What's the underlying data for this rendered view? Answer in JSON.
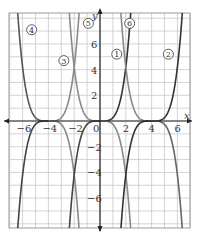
{
  "chart_data": {
    "type": "line",
    "title": "",
    "xlabel": "x",
    "ylabel": "y",
    "xlim": [
      -7,
      7
    ],
    "ylim": [
      -8.3,
      8.5
    ],
    "grid": true,
    "x_ticks": [
      "-6",
      "-4",
      "-2",
      "0",
      "2",
      "4",
      "6"
    ],
    "y_ticks": [
      "6",
      "4",
      "2",
      "-2",
      "-4",
      "-6"
    ],
    "series": [
      {
        "name": "1",
        "vertex_x": 0,
        "direction": "up",
        "branch": "right",
        "color": "#333333"
      },
      {
        "name": "2",
        "vertex_x": 4,
        "direction": "up",
        "branch": "right",
        "color": "#333333"
      },
      {
        "name": "3",
        "vertex_x": -4,
        "direction": "up",
        "branch": "right",
        "color": "#888888"
      },
      {
        "name": "4",
        "vertex_x": -4,
        "direction": "up",
        "branch": "left",
        "color": "#555555"
      },
      {
        "name": "5",
        "vertex_x": 0,
        "direction": "up",
        "branch": "left",
        "color": "#888888"
      },
      {
        "name": "6",
        "vertex_x": 4,
        "direction": "up",
        "branch": "left",
        "color": "#888888"
      }
    ],
    "curves": [
      {
        "vertex_x": -4,
        "sign": 1,
        "color_left": "#555555",
        "color_right": "#8a8a8a"
      },
      {
        "vertex_x": 0,
        "sign": 1,
        "color_left": "#8a8a8a",
        "color_right": "#333333"
      },
      {
        "vertex_x": 4,
        "sign": 1,
        "color_left": "#8a8a8a",
        "color_right": "#333333"
      },
      {
        "vertex_x": -4,
        "sign": -1,
        "color_left": "#444444",
        "color_right": "#8a8a8a"
      },
      {
        "vertex_x": 0,
        "sign": -1,
        "color_left": "#444444",
        "color_right": "#8a8a8a"
      },
      {
        "vertex_x": 4,
        "sign": -1,
        "color_left": "#333333",
        "color_right": "#666666"
      }
    ],
    "labels": [
      {
        "text": "4",
        "x": -5.3,
        "y": 7.1
      },
      {
        "text": "3",
        "x": -2.8,
        "y": 4.7
      },
      {
        "text": "5",
        "x": -0.9,
        "y": 7.6
      },
      {
        "text": "1",
        "x": 1.3,
        "y": 5.2
      },
      {
        "text": "6",
        "x": 2.3,
        "y": 7.6
      },
      {
        "text": "2",
        "x": 5.3,
        "y": 5.2
      }
    ]
  }
}
